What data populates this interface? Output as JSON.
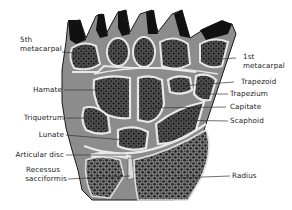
{
  "diagram": {
    "colors": {
      "background": "#ffffff",
      "bone_fill": "#6e6e6e",
      "cancellous": "#2a2a2a",
      "cartilage": "#e8e8e8",
      "dark_tissue": "#121212",
      "outline": "#1a1a1a",
      "leader": "#333333"
    },
    "labels_left": [
      {
        "id": "fifth-metacarpal",
        "line1": "5th",
        "line2": "metacarpal"
      },
      {
        "id": "hamate",
        "line1": "Hamate"
      },
      {
        "id": "triquetrum",
        "line1": "Triquetrum"
      },
      {
        "id": "lunate",
        "line1": "Lunate"
      },
      {
        "id": "articular-disc",
        "line1": "Articular disc"
      },
      {
        "id": "recessus-sacciformis",
        "line1": "Recessus",
        "line2": "sacciformis"
      }
    ],
    "labels_right": [
      {
        "id": "first-metacarpal",
        "line1": "1st",
        "line2": "metacarpal"
      },
      {
        "id": "trapezoid",
        "line1": "Trapezoid"
      },
      {
        "id": "trapezium",
        "line1": "Trapezium"
      },
      {
        "id": "capitate",
        "line1": "Capitate"
      },
      {
        "id": "scaphoid",
        "line1": "Scaphoid"
      },
      {
        "id": "radius",
        "line1": "Radius"
      }
    ]
  }
}
